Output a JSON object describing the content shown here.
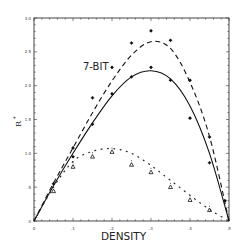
{
  "chart_data": {
    "type": "line",
    "title": "",
    "xlabel": "DENSITY",
    "ylabel": "R*",
    "xlim": [
      0,
      0.5
    ],
    "ylim": [
      0,
      3.0
    ],
    "x_ticks": [
      "0",
      ".1",
      ".2",
      ".3",
      ".4",
      ".5"
    ],
    "y_ticks": [
      "0",
      ".5",
      "1.0",
      "1.5",
      "2.0",
      "2.5",
      "3.0"
    ],
    "grid": false,
    "legend": null,
    "annotations": [
      {
        "text": "7-BIT",
        "x": 0.13,
        "y": 2.25
      }
    ],
    "series": [
      {
        "name": "7-BIT (dashed curve)",
        "style": "dashed",
        "x": [
          0,
          0.05,
          0.1,
          0.15,
          0.2,
          0.25,
          0.3,
          0.35,
          0.4,
          0.45,
          0.5
        ],
        "y": [
          0,
          0.56,
          1.08,
          1.6,
          2.07,
          2.45,
          2.65,
          2.55,
          2.05,
          1.25,
          0
        ]
      },
      {
        "name": "solid curve",
        "style": "solid",
        "x": [
          0,
          0.05,
          0.1,
          0.15,
          0.2,
          0.25,
          0.3,
          0.35,
          0.4,
          0.45,
          0.5
        ],
        "y": [
          0,
          0.52,
          1.0,
          1.45,
          1.85,
          2.13,
          2.22,
          2.1,
          1.7,
          1.0,
          0
        ]
      },
      {
        "name": "dotted curve",
        "style": "dotted",
        "x": [
          0,
          0.05,
          0.1,
          0.15,
          0.2,
          0.25,
          0.3,
          0.35,
          0.4,
          0.45,
          0.5
        ],
        "y": [
          0,
          0.5,
          0.88,
          1.03,
          1.07,
          1.0,
          0.82,
          0.6,
          0.38,
          0.17,
          0
        ]
      },
      {
        "name": "star markers (upper)",
        "style": "marker-star",
        "x": [
          0.05,
          0.1,
          0.15,
          0.2,
          0.25,
          0.3,
          0.35,
          0.4,
          0.45,
          0.49
        ],
        "y": [
          0.55,
          1.08,
          1.82,
          2.27,
          2.63,
          2.81,
          2.67,
          2.08,
          1.24,
          0.3
        ]
      },
      {
        "name": "star markers (lower)",
        "style": "marker-star",
        "x": [
          0.1,
          0.15,
          0.2,
          0.25,
          0.3,
          0.35,
          0.4,
          0.45
        ],
        "y": [
          0.95,
          1.43,
          1.88,
          2.13,
          2.27,
          2.08,
          1.52,
          0.86
        ]
      },
      {
        "name": "triangle markers",
        "style": "marker-triangle",
        "x": [
          0.05,
          0.1,
          0.15,
          0.2,
          0.25,
          0.3,
          0.35,
          0.4,
          0.45
        ],
        "y": [
          0.44,
          0.8,
          0.95,
          1.02,
          0.83,
          0.72,
          0.5,
          0.31,
          0.16
        ]
      }
    ]
  },
  "axes": {
    "x_title": "DENSITY",
    "y_title": "R",
    "y_title_sup": "*"
  },
  "annotation_text": "7-BIT"
}
